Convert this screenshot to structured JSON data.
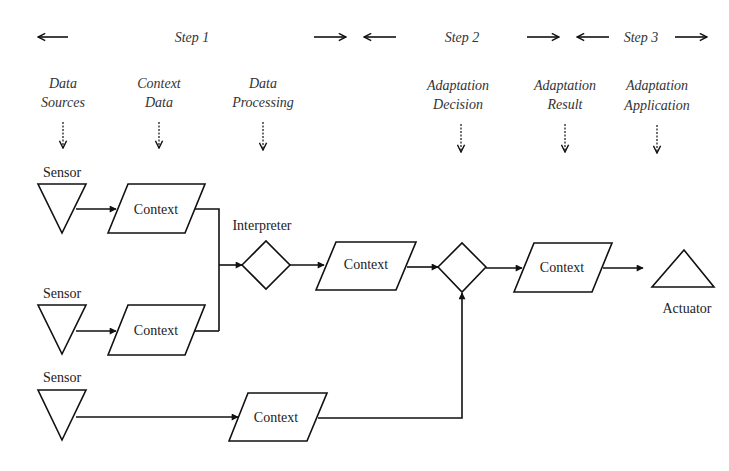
{
  "steps": [
    {
      "label": "Step 1"
    },
    {
      "label": "Step 2"
    },
    {
      "label": "Step 3"
    }
  ],
  "phases": [
    {
      "line1": "Data",
      "line2": "Sources"
    },
    {
      "line1": "Context",
      "line2": "Data"
    },
    {
      "line1": "Data",
      "line2": "Processing"
    },
    {
      "line1": "Adaptation",
      "line2": "Decision"
    },
    {
      "line1": "Adaptation",
      "line2": "Result"
    },
    {
      "line1": "Adaptation",
      "line2": "Application"
    }
  ],
  "nodes": {
    "sensor_1": "Sensor",
    "sensor_2": "Sensor",
    "sensor_3": "Sensor",
    "context_1": "Context",
    "context_2": "Context",
    "context_3": "Context",
    "context_4": "Context",
    "context_5": "Context",
    "interpreter": "Interpreter",
    "actuator": "Actuator"
  }
}
